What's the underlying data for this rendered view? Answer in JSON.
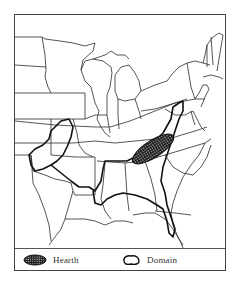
{
  "figure": {
    "type": "map",
    "region": "Eastern United States",
    "legend": {
      "items": [
        {
          "key": "hearth",
          "label": "Hearth",
          "symbol": "crosshatched-filled-ellipse"
        },
        {
          "key": "domain",
          "label": "Domain",
          "symbol": "heavy-outline-shape"
        }
      ]
    },
    "colors": {
      "border": "#333333",
      "fill_hatch": "#1a1a1a",
      "background": "#ffffff"
    }
  }
}
